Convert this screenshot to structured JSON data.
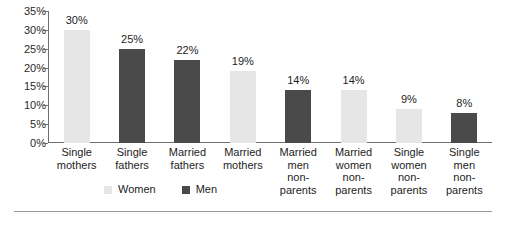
{
  "chart_data": {
    "type": "bar",
    "title": "",
    "subtitle": "",
    "xlabel": "",
    "ylabel": "",
    "ylim": [
      0,
      35
    ],
    "ytick_labels": [
      "35%",
      "30%",
      "25%",
      "20%",
      "15%",
      "10%",
      "5%",
      "0%"
    ],
    "ytick_values": [
      35,
      30,
      25,
      20,
      15,
      10,
      5,
      0
    ],
    "grid": false,
    "legend_position": "bottom-left",
    "categories": [
      "Single mothers",
      "Single fathers",
      "Married fathers",
      "Married mothers",
      "Married men non-parents",
      "Married women non-parents",
      "Single women non-parents",
      "Single men non-parents"
    ],
    "category_label_lines": [
      [
        "Single",
        "mothers"
      ],
      [
        "Single",
        "fathers"
      ],
      [
        "Married",
        "fathers"
      ],
      [
        "Married",
        "mothers"
      ],
      [
        "Married",
        "men",
        "non-",
        "parents"
      ],
      [
        "Married",
        "women",
        "non-",
        "parents"
      ],
      [
        "Single",
        "women",
        "non-",
        "parents"
      ],
      [
        "Single",
        "men",
        "non-",
        "parents"
      ]
    ],
    "values": [
      30,
      25,
      22,
      19,
      14,
      14,
      9,
      8
    ],
    "value_labels": [
      "30%",
      "25%",
      "22%",
      "19%",
      "14%",
      "14%",
      "9%",
      "8%"
    ],
    "series_of_bar": [
      "Women",
      "Men",
      "Men",
      "Women",
      "Men",
      "Women",
      "Women",
      "Men"
    ],
    "series": [
      {
        "name": "Women",
        "color": "#e6e6e6"
      },
      {
        "name": "Men",
        "color": "#4a4a4a"
      }
    ]
  },
  "legend": {
    "items": [
      {
        "label": "Women",
        "key": "women"
      },
      {
        "label": "Men",
        "key": "men"
      }
    ]
  },
  "colors": {
    "women_bar": "#e6e6e6",
    "men_bar": "#4a4a4a",
    "axis": "#6f6f6f",
    "text": "#1d1d1d",
    "rule": "#9a9a9a",
    "background": "#ffffff"
  }
}
